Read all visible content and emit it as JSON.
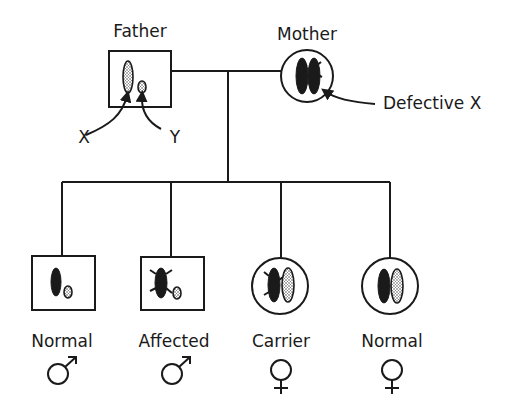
{
  "parents": {
    "father": {
      "label": "Father",
      "sex": "male",
      "chromosomes": [
        "X (normal)",
        "Y"
      ]
    },
    "mother": {
      "label": "Mother",
      "sex": "female",
      "chromosomes": [
        "X (normal)",
        "X (defective)"
      ]
    }
  },
  "annotations": {
    "x_label": "X",
    "y_label": "Y",
    "defective_label": "Defective X"
  },
  "children": [
    {
      "label": "Normal",
      "sex": "male",
      "symbol": "♂",
      "chromosomes": [
        "X (normal)",
        "Y"
      ]
    },
    {
      "label": "Affected",
      "sex": "male",
      "symbol": "♂",
      "chromosomes": [
        "X (defective)",
        "Y"
      ]
    },
    {
      "label": "Carrier",
      "sex": "female",
      "symbol": "♀",
      "chromosomes": [
        "X (defective)",
        "X (normal)"
      ]
    },
    {
      "label": "Normal",
      "sex": "female",
      "symbol": "♀",
      "chromosomes": [
        "X (normal)",
        "X (normal)"
      ]
    }
  ],
  "colors": {
    "ink": "#1a1a1a",
    "background": "#ffffff"
  }
}
